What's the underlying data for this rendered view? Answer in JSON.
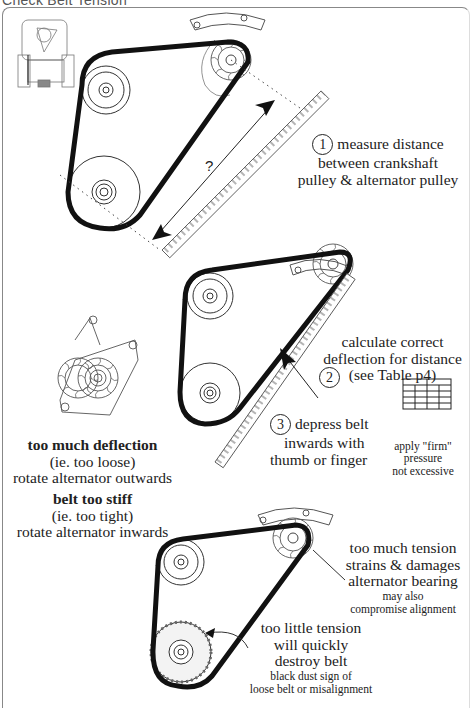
{
  "title": "Check Belt Tension",
  "colors": {
    "belt": "#111111",
    "line": "#444444",
    "frame": "#888888",
    "text": "#222222"
  },
  "step1": {
    "number": "1",
    "lines": [
      "measure distance",
      "between crankshaft",
      "pulley & alternator pulley"
    ],
    "distance_label": "?"
  },
  "step2": {
    "number": "2",
    "lines": [
      "calculate correct",
      "deflection for distance",
      "(see Table p4)"
    ],
    "icon": "table-icon"
  },
  "step3": {
    "number": "3",
    "lines": [
      "depress belt",
      "inwards with",
      "thumb or finger"
    ],
    "note": [
      "apply \"firm\"",
      "pressure",
      "not excessive"
    ]
  },
  "too_loose": {
    "heading": "too much deflection",
    "lines": [
      "(ie. too loose)",
      "rotate alternator outwards"
    ]
  },
  "too_tight": {
    "heading": "belt too stiff",
    "lines": [
      "(ie. too tight)",
      "rotate alternator inwards"
    ]
  },
  "too_much_tension": {
    "lines": [
      "too much tension",
      "strains & damages",
      "alternator bearing"
    ],
    "sub": [
      "may also",
      "compromise alignment"
    ]
  },
  "too_little_tension": {
    "lines": [
      "too little tension",
      "will quickly",
      "destroy belt"
    ],
    "sub": [
      "black dust sign of",
      "loose belt or misalignment"
    ]
  }
}
